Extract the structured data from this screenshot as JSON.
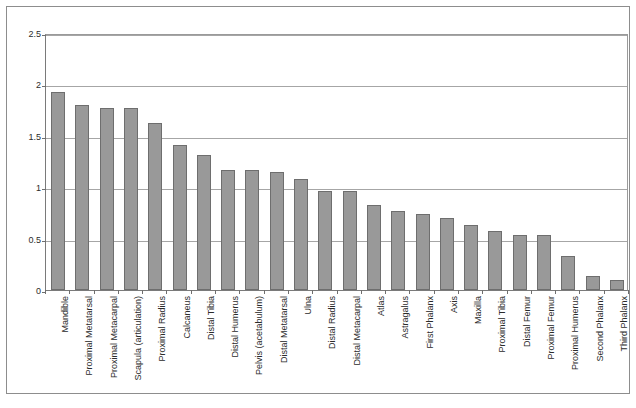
{
  "chart_data": {
    "type": "bar",
    "title": "",
    "subtitle": "",
    "xlabel": "",
    "ylabel": "",
    "ylim": [
      0,
      2.5
    ],
    "ytick_values": [
      0,
      0.5,
      1,
      1.5,
      2,
      2.5
    ],
    "ytick_labels": [
      "0",
      "0.5",
      "1",
      "1.5",
      "2",
      "2.5"
    ],
    "grid": true,
    "legend": false,
    "legend_position": "none",
    "bar_color": "#999999",
    "bar_border_color": "#6e6e6e",
    "gridline_color": "#a6a6a6",
    "axis_color": "#7a7a7a",
    "categories": [
      "Mandible",
      "Proximal Metatarsal",
      "Proximal Metacarpal",
      "Scapula (articulation)",
      "Proximal Radius",
      "Calcaneus",
      "Distal Tibia",
      "Distal Humerus",
      "Pelvis (acetabulum)",
      "Distal Metatarsal",
      "Ulna",
      "Distal Radius",
      "Distal Metacarpal",
      "Atlas",
      "Astragalus",
      "First Phalanx",
      "Axis",
      "Maxilla",
      "Proximal Tibia",
      "Distal Femur",
      "Proximal Femur",
      "Proximal Humerus",
      "Second Phalanx",
      "Third Phalanx"
    ],
    "values": [
      1.93,
      1.8,
      1.77,
      1.77,
      1.62,
      1.41,
      1.31,
      1.17,
      1.17,
      1.15,
      1.08,
      0.96,
      0.96,
      0.83,
      0.77,
      0.74,
      0.7,
      0.63,
      0.57,
      0.54,
      0.54,
      0.33,
      0.14,
      0.1
    ]
  }
}
